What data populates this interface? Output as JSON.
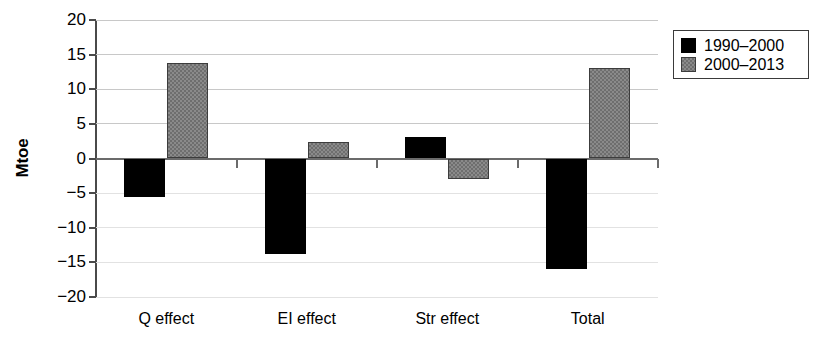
{
  "chart_data": {
    "type": "bar",
    "title": "",
    "xlabel": "",
    "ylabel": "Mtoe",
    "categories": [
      "Q effect",
      "EI effect",
      "Str effect",
      "Total"
    ],
    "series": [
      {
        "name": "1990–2000",
        "color": "#000000",
        "values": [
          -5.5,
          -13.8,
          3.1,
          -16.0
        ]
      },
      {
        "name": "2000–2013",
        "color": "#8a8a8a",
        "values": [
          13.8,
          2.4,
          -3.0,
          13.1
        ]
      }
    ],
    "ylim": [
      -20,
      20
    ],
    "yticks": [
      20,
      15,
      10,
      5,
      0,
      -5,
      -10,
      -15,
      -20
    ],
    "ytick_labels": [
      "20",
      "15",
      "10",
      "5",
      "0",
      "−5",
      "−10",
      "−15",
      "−20"
    ],
    "grid": true,
    "grid_axis": "y",
    "legend_position": "right-top",
    "zero_line": 0
  },
  "legend": {
    "entries": [
      {
        "label": "1990–2000",
        "swatch": "black-square-swatch"
      },
      {
        "label": "2000–2013",
        "swatch": "gray-square-swatch"
      }
    ]
  },
  "axes": {
    "y_title": "Mtoe"
  }
}
